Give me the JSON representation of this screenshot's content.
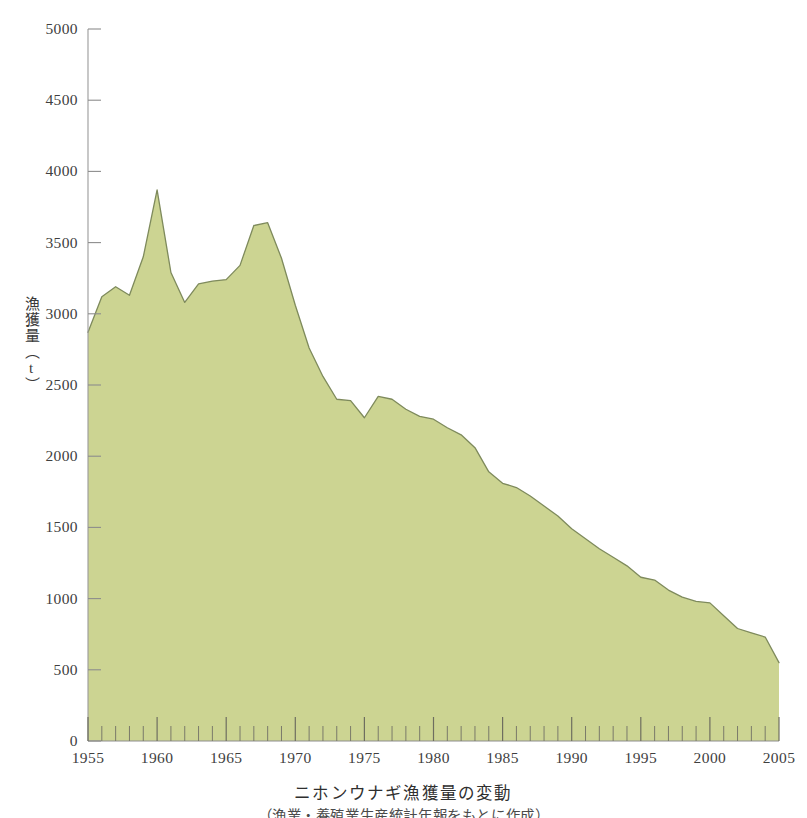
{
  "chart_data": {
    "type": "area",
    "title": "ニホンウナギ漁獲量の変動",
    "subtitle": "（漁業・養殖業生産統計年報をもとに作成）",
    "xlabel": "",
    "ylabel": "漁獲量（t）",
    "ylabel_chars": [
      "漁",
      "獲",
      "量",
      "（",
      "t",
      "）"
    ],
    "xlim": [
      1955,
      2005
    ],
    "ylim": [
      0,
      5000
    ],
    "grid": false,
    "legend": "none",
    "fill_color": "#ccd492",
    "line_color": "#7e8a5c",
    "axis_color": "#8a8a8a",
    "y_ticks": [
      0,
      500,
      1000,
      1500,
      2000,
      2500,
      3000,
      3500,
      4000,
      4500,
      5000
    ],
    "y_tick_labels": [
      "0",
      "500",
      "1000",
      "1500",
      "2000",
      "2500",
      "3000",
      "3500",
      "4000",
      "4500",
      "5000"
    ],
    "x_major_ticks": [
      1955,
      1960,
      1965,
      1970,
      1975,
      1980,
      1985,
      1990,
      1995,
      2000,
      2005
    ],
    "x_major_tick_labels": [
      "1955",
      "1960",
      "1965",
      "1970",
      "1975",
      "1980",
      "1985",
      "1990",
      "1995",
      "2000",
      "2005"
    ],
    "x_minor_tick_interval": 1,
    "x": [
      1955,
      1956,
      1957,
      1958,
      1959,
      1960,
      1961,
      1962,
      1963,
      1964,
      1965,
      1966,
      1967,
      1968,
      1969,
      1970,
      1971,
      1972,
      1973,
      1974,
      1975,
      1976,
      1977,
      1978,
      1979,
      1980,
      1981,
      1982,
      1983,
      1984,
      1985,
      1986,
      1987,
      1988,
      1989,
      1990,
      1991,
      1992,
      1993,
      1994,
      1995,
      1996,
      1997,
      1998,
      1999,
      2000,
      2001,
      2002,
      2003,
      2004,
      2005
    ],
    "values": [
      2870,
      3120,
      3190,
      3130,
      3400,
      3870,
      3290,
      3080,
      3210,
      3230,
      3240,
      3340,
      3620,
      3640,
      3390,
      3060,
      2760,
      2560,
      2400,
      2390,
      2270,
      2420,
      2400,
      2330,
      2280,
      2260,
      2200,
      2150,
      2060,
      1890,
      1810,
      1780,
      1720,
      1650,
      1580,
      1490,
      1420,
      1350,
      1290,
      1230,
      1150,
      1130,
      1060,
      1010,
      980,
      970,
      880,
      790,
      760,
      730,
      550
    ],
    "series_name": "ニホンウナギ漁獲量",
    "units": "t",
    "annotations": {
      "peak_year": 1960,
      "peak_value": 3870,
      "final_year": 2005,
      "final_value": 550
    }
  }
}
